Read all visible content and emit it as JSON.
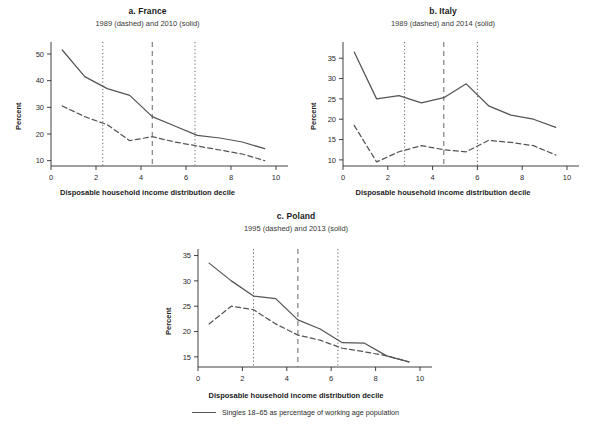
{
  "figure": {
    "xlabel": "Disposable household income distribution decile",
    "ylabel": "Percent",
    "legend_text": "Singles 18–65 as percentage of working age population",
    "legend_marker": "solid-line-icon",
    "line_color": "#555555",
    "text_color": "#2b2b2b",
    "background": "#ffffff"
  },
  "chart_data": [
    {
      "type": "line",
      "panel": "a",
      "title": "a. France",
      "subtitle": "1989 (dashed) and 2010 (solid)",
      "xlabel": "Disposable household income distribution decile",
      "ylabel": "Percent",
      "xlim": [
        0,
        10
      ],
      "ylim": [
        8,
        53
      ],
      "xticks": [
        0,
        2,
        4,
        6,
        8,
        10
      ],
      "yticks": [
        10,
        20,
        30,
        40,
        50
      ],
      "grid": false,
      "legend_position": "bottom-figure",
      "vlines": [
        {
          "x": 2.3,
          "style": "dotted"
        },
        {
          "x": 4.5,
          "style": "dashed"
        },
        {
          "x": 6.4,
          "style": "dotted"
        }
      ],
      "series": [
        {
          "name": "2010",
          "style": "solid",
          "x": [
            0.5,
            1.5,
            2.5,
            3.5,
            4.5,
            5.5,
            6.5,
            7.5,
            8.5,
            9.5
          ],
          "values": [
            51.5,
            41.5,
            37.0,
            34.5,
            26.5,
            23.0,
            19.5,
            18.5,
            17.0,
            14.5
          ]
        },
        {
          "name": "1989",
          "style": "dashed",
          "x": [
            0.5,
            1.5,
            2.5,
            3.5,
            4.5,
            5.5,
            6.5,
            7.5,
            8.5,
            9.5
          ],
          "values": [
            30.5,
            26.5,
            23.5,
            17.5,
            19.0,
            17.0,
            15.5,
            14.0,
            12.5,
            10.0
          ]
        }
      ]
    },
    {
      "type": "line",
      "panel": "b",
      "title": "b. Italy",
      "subtitle": "1989 (dashed) and 2014 (solid)",
      "xlabel": "Disposable household income distribution decile",
      "ylabel": "Percent",
      "xlim": [
        0,
        10
      ],
      "ylim": [
        8.5,
        38
      ],
      "xticks": [
        0,
        2,
        4,
        6,
        8,
        10
      ],
      "yticks": [
        10,
        15,
        20,
        25,
        30,
        35
      ],
      "grid": false,
      "legend_position": "bottom-figure",
      "vlines": [
        {
          "x": 2.75,
          "style": "dotted"
        },
        {
          "x": 4.5,
          "style": "dashed"
        },
        {
          "x": 6.0,
          "style": "dotted"
        }
      ],
      "series": [
        {
          "name": "2014",
          "style": "solid",
          "x": [
            0.5,
            1.5,
            2.5,
            3.5,
            4.5,
            5.5,
            6.5,
            7.5,
            8.5,
            9.5
          ],
          "values": [
            36.5,
            25.0,
            25.8,
            24.0,
            25.3,
            28.7,
            23.3,
            21.0,
            20.0,
            18.0
          ]
        },
        {
          "name": "1989",
          "style": "dashed",
          "x": [
            0.5,
            1.5,
            2.5,
            3.5,
            4.5,
            5.5,
            6.5,
            7.5,
            8.5,
            9.5
          ],
          "values": [
            18.5,
            9.5,
            12.0,
            13.5,
            12.5,
            12.0,
            14.8,
            14.3,
            13.5,
            11.2
          ]
        }
      ]
    },
    {
      "type": "line",
      "panel": "c",
      "title": "c. Poland",
      "subtitle": "1995 (dashed) and 2013 (solid)",
      "xlabel": "Disposable household income distribution decile",
      "ylabel": "Percent",
      "xlim": [
        0,
        10
      ],
      "ylim": [
        13,
        35.5
      ],
      "xticks": [
        0,
        2,
        4,
        6,
        8,
        10
      ],
      "yticks": [
        15,
        20,
        25,
        30,
        35
      ],
      "grid": false,
      "legend_position": "bottom-figure",
      "vlines": [
        {
          "x": 2.5,
          "style": "dotted"
        },
        {
          "x": 4.5,
          "style": "dashed"
        },
        {
          "x": 6.3,
          "style": "dotted"
        }
      ],
      "series": [
        {
          "name": "2013",
          "style": "solid",
          "x": [
            0.5,
            1.5,
            2.5,
            3.5,
            4.5,
            5.5,
            6.5,
            7.5,
            8.5,
            9.5
          ],
          "values": [
            33.5,
            30.0,
            27.0,
            26.5,
            22.3,
            20.5,
            17.8,
            17.7,
            15.2,
            14.0
          ]
        },
        {
          "name": "1995",
          "style": "dashed",
          "x": [
            0.5,
            1.5,
            2.5,
            3.5,
            4.5,
            5.5,
            6.5,
            7.5,
            8.5,
            9.5
          ],
          "values": [
            21.5,
            25.0,
            24.3,
            21.5,
            19.3,
            18.3,
            16.7,
            16.0,
            15.2,
            14.0
          ]
        }
      ]
    }
  ]
}
